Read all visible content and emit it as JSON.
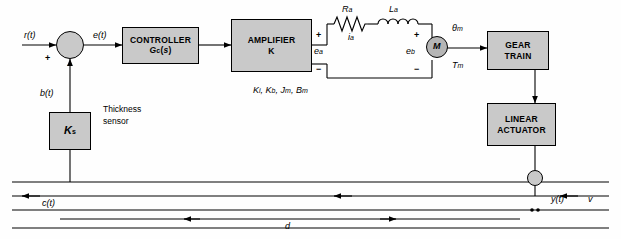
{
  "diagram": {
    "blocks": [
      {
        "id": "controller",
        "line1": "CONTROLLER",
        "line2": "G_c(s)",
        "label_main": "CONTROLLER",
        "label_sub": "Gc(s)"
      },
      {
        "id": "amplifier",
        "label_main": "AMPLIFIER",
        "label_sub": "K"
      },
      {
        "id": "gear_train",
        "label_main": "GEAR",
        "label_sub": "TRAIN"
      },
      {
        "id": "linear_actuator",
        "label_main": "LINEAR",
        "label_sub": "ACTUATOR"
      },
      {
        "id": "sensor_gain",
        "label_main": "K",
        "label_sub": "s"
      }
    ],
    "signals": {
      "reference": "r(t)",
      "error": "e(t)",
      "feedback": "b(t)",
      "output": "c(t)",
      "actuator_out": "y(t)",
      "velocity": "v",
      "distance": "d",
      "armature_resistance": "R_a",
      "armature_inductance": "L_a",
      "armature_current": "i_a",
      "armature_voltage": "e_a",
      "back_emf": "e_b",
      "motor": "M",
      "motor_angle": "θ_m",
      "motor_torque": "T_m",
      "motor_params": "K_i, K_b, J_m, B_m"
    },
    "annotations": {
      "sensor_text_line1": "Thickness",
      "sensor_text_line2": "sensor",
      "plus_sign": "+",
      "minus_sign": "−"
    }
  }
}
